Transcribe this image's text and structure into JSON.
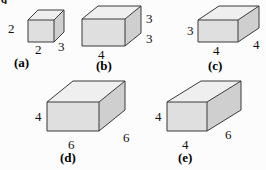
{
  "question_number": "9.",
  "figures": [
    {
      "id": "a",
      "caption": "(a)",
      "labels": {
        "height": "2",
        "width": "2",
        "depth": "3"
      }
    },
    {
      "id": "b",
      "caption": "(b)",
      "labels": {
        "height": "3",
        "width": "4",
        "depth": "3"
      }
    },
    {
      "id": "c",
      "caption": "(c)",
      "labels": {
        "height": "3",
        "width": "4",
        "depth": "4"
      }
    },
    {
      "id": "d",
      "caption": "(d)",
      "labels": {
        "height": "4",
        "width": "6",
        "depth": "6"
      }
    },
    {
      "id": "e",
      "caption": "(e)",
      "labels": {
        "height": "4",
        "width": "4",
        "depth": "6"
      }
    }
  ],
  "colors": {
    "front_face": "#dfdfdf",
    "top_face": "#efefef",
    "side_face": "#cfcfcf",
    "edge": "#3a3a3a",
    "background": "#fcfcfc",
    "text": "#111111"
  }
}
